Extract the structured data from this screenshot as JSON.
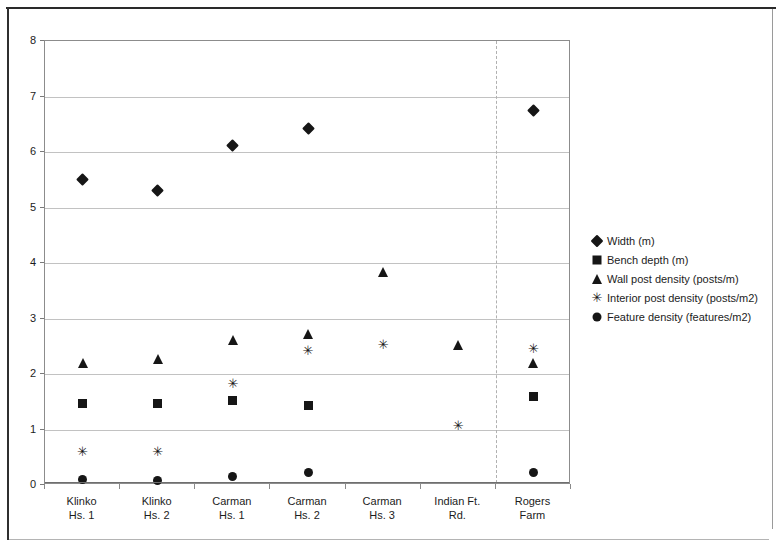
{
  "chart_data": {
    "type": "scatter",
    "title": "",
    "xlabel": "",
    "ylabel": "",
    "ylim": [
      0,
      8
    ],
    "ytick_step": 1,
    "grid": true,
    "legend_position": "right",
    "categories": [
      "Klinko\nHs. 1",
      "Klinko\nHs. 2",
      "Carman\nHs. 1",
      "Carman\nHs. 2",
      "Carman\nHs. 3",
      "Indian Ft.\nRd.",
      "Rogers\nFarm"
    ],
    "category_labels": [
      {
        "line1": "Klinko",
        "line2": "Hs. 1"
      },
      {
        "line1": "Klinko",
        "line2": "Hs. 2"
      },
      {
        "line1": "Carman",
        "line2": "Hs. 1"
      },
      {
        "line1": "Carman",
        "line2": "Hs. 2"
      },
      {
        "line1": "Carman",
        "line2": "Hs. 3"
      },
      {
        "line1": "Indian Ft.",
        "line2": "Rd."
      },
      {
        "line1": "Rogers",
        "line2": "Farm"
      }
    ],
    "ytick_labels": [
      "0",
      "1",
      "2",
      "3",
      "4",
      "5",
      "6",
      "7",
      "8"
    ],
    "separator_after_category_index": 5,
    "series": [
      {
        "name": "Width (m)",
        "marker": "diamond",
        "values": [
          5.5,
          5.3,
          6.12,
          6.43,
          null,
          null,
          6.75
        ]
      },
      {
        "name": "Bench depth (m)",
        "marker": "square",
        "values": [
          1.47,
          1.47,
          1.52,
          1.43,
          null,
          null,
          1.6
        ]
      },
      {
        "name": "Wall post density (posts/m)",
        "marker": "triangle",
        "values": [
          2.2,
          2.27,
          2.62,
          2.72,
          3.83,
          2.52,
          2.2
        ]
      },
      {
        "name": "Interior post density (posts/m2)",
        "marker": "ex",
        "values": [
          0.6,
          0.6,
          1.82,
          2.42,
          2.52,
          1.07,
          2.45
        ]
      },
      {
        "name": "Feature density (features/m2)",
        "marker": "circle",
        "values": [
          0.1,
          0.08,
          0.15,
          0.22,
          null,
          null,
          0.22
        ]
      }
    ]
  },
  "legend": {
    "entries": [
      {
        "label": "Width (m)",
        "marker": "diamond"
      },
      {
        "label": "Bench depth (m)",
        "marker": "square"
      },
      {
        "label": "Wall post density (posts/m)",
        "marker": "triangle"
      },
      {
        "label": "Interior post density (posts/m2)",
        "marker": "ex"
      },
      {
        "label": "Feature density (features/m2)",
        "marker": "circle"
      }
    ]
  },
  "colors": {
    "marker": "#161616",
    "gridline": "#c2c2c2",
    "axis": "#6f6f6f",
    "frame": "#2a2a2a",
    "text": "#1c1c1c",
    "background": "#ffffff"
  },
  "glyphs": {
    "ex": "✳"
  }
}
